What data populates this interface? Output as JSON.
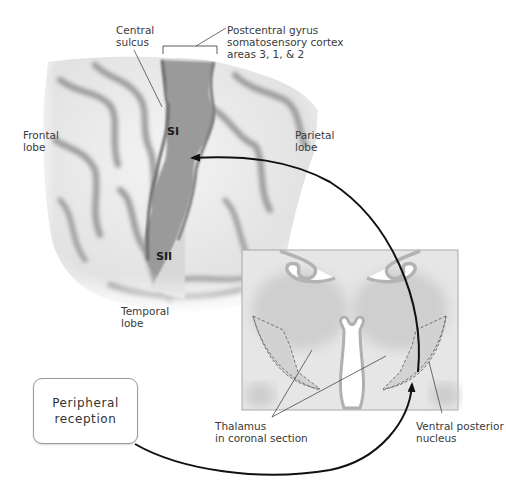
{
  "labels": {
    "central_sulcus": "Central\nsulcus",
    "central_sulcus_line1": "Central",
    "central_sulcus_line2": "sulcus",
    "postcentral_line1": "Postcentral gyrus",
    "postcentral_line2": "somatosensory cortex",
    "postcentral_line3": "areas 3, 1, & 2",
    "frontal_line1": "Frontal",
    "frontal_line2": "lobe",
    "parietal_line1": "Parietal",
    "parietal_line2": "lobe",
    "temporal_line1": "Temporal",
    "temporal_line2": "lobe",
    "si": "SI",
    "sii": "SII",
    "thalamus_line1": "Thalamus",
    "thalamus_line2": "in coronal section",
    "vpn_line1": "Ventral posterior",
    "vpn_line2": "nucleus"
  },
  "box": {
    "text": "Peripheral\nreception"
  },
  "colors": {
    "brain_light": "#ededed",
    "brain_shadow": "#9c9c9c",
    "somatosensory": "#9a9a9a",
    "thalamus_bg": "#e4e4e4",
    "thalamus_nucleus": "#cfcfcf",
    "arrow": "#111111"
  }
}
